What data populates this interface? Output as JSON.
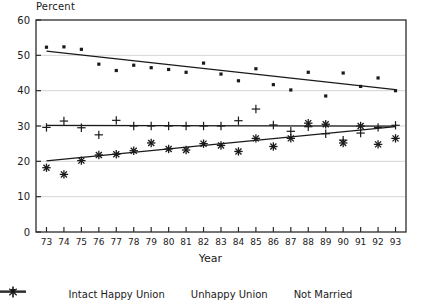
{
  "axis": {
    "ylabel": "Percent",
    "xlabel": "Year",
    "yticks": [
      "0",
      "10",
      "20",
      "30",
      "40",
      "50",
      "60"
    ],
    "xticks": [
      "73",
      "74",
      "75",
      "76",
      "77",
      "78",
      "79",
      "80",
      "81",
      "82",
      "83",
      "84",
      "85",
      "86",
      "87",
      "88",
      "89",
      "90",
      "91",
      "92",
      "93"
    ]
  },
  "legend": {
    "items": [
      {
        "label": "Intact Happy Union",
        "marker": "dot-marker-icon"
      },
      {
        "label": "Unhappy Union",
        "marker": "plus-marker-icon"
      },
      {
        "label": "Not Married",
        "marker": "asterisk-marker-icon"
      }
    ]
  },
  "chart_data": {
    "type": "scatter",
    "title": "",
    "xlabel": "Year",
    "ylabel": "Percent",
    "xlim": [
      72.4,
      93.6
    ],
    "ylim": [
      0,
      60
    ],
    "xticks": [
      73,
      74,
      75,
      76,
      77,
      78,
      79,
      80,
      81,
      82,
      83,
      84,
      85,
      86,
      87,
      88,
      89,
      90,
      91,
      92,
      93
    ],
    "yticks": [
      0,
      10,
      20,
      30,
      40,
      50,
      60
    ],
    "grid": true,
    "legend_position": "bottom",
    "x": [
      73,
      74,
      75,
      76,
      77,
      78,
      79,
      80,
      81,
      82,
      83,
      84,
      85,
      86,
      87,
      88,
      89,
      90,
      91,
      92,
      93
    ],
    "series": [
      {
        "name": "Intact Happy Union",
        "marker": "dot",
        "values": [
          52.3,
          52.4,
          51.7,
          47.5,
          45.7,
          47.2,
          46.5,
          46.0,
          45.2,
          47.8,
          44.7,
          42.8,
          46.2,
          41.7,
          40.2,
          45.2,
          38.5,
          45.0,
          41.2,
          43.6,
          40.0
        ],
        "trend": {
          "type": "linear",
          "start_y": 51.2,
          "end_y": 40.3
        }
      },
      {
        "name": "Unhappy Union",
        "marker": "plus",
        "values": [
          29.6,
          31.4,
          29.5,
          27.5,
          31.6,
          30.0,
          30.0,
          30.0,
          30.0,
          30.0,
          30.0,
          31.5,
          34.8,
          30.3,
          28.5,
          29.8,
          27.8,
          26.0,
          28.0,
          29.6,
          30.2
        ],
        "trend": {
          "type": "linear",
          "start_y": 30.2,
          "end_y": 30.0
        }
      },
      {
        "name": "Not Married",
        "marker": "asterisk",
        "values": [
          18.2,
          16.3,
          20.2,
          21.8,
          22.0,
          23.0,
          25.2,
          23.5,
          23.2,
          25.0,
          24.5,
          22.8,
          26.5,
          24.2,
          26.5,
          30.8,
          30.5,
          25.2,
          30.0,
          24.8,
          26.5
        ],
        "trend": {
          "type": "linear",
          "start_y": 20.1,
          "end_y": 29.8
        }
      }
    ]
  }
}
